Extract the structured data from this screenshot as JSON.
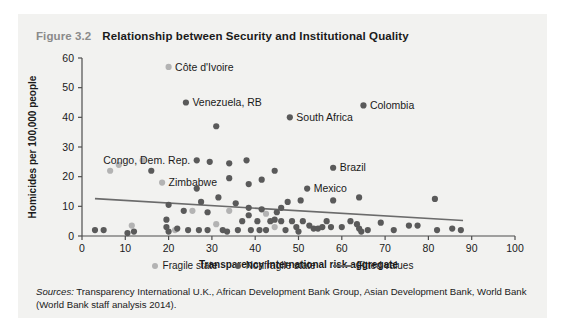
{
  "figure": {
    "number": "Figure 3.2",
    "title": "Relationship between Security and Institutional Quality",
    "sources_prefix": "Sources:",
    "sources_text": " Transparency International U.K., African Development Bank Group, Asian Development Bank, World Bank (World Bank staff analysis 2014)."
  },
  "legend": {
    "fragile_label": "Fragile state",
    "nonfragile_label": "Nonfragile state",
    "fitted_label": "Fitted values"
  },
  "colors": {
    "panel_background": "#f2f2f0",
    "fragile": "#b3b3b3",
    "nonfragile": "#5a5a5a",
    "fitted_line": "#6b6b6b",
    "axis": "#4d4d4d",
    "title": "#1a1a1a",
    "figure_number": "#8a8a8a"
  },
  "chart_data": {
    "type": "scatter",
    "title": "Relationship between Security and Institutional Quality",
    "xlabel": "Transparency International risk aggregate",
    "ylabel": "Homicides per 100,000 people",
    "xlim": [
      0,
      100
    ],
    "ylim": [
      0,
      60
    ],
    "xticks": [
      0,
      10,
      20,
      30,
      40,
      50,
      60,
      70,
      80,
      90,
      100
    ],
    "yticks": [
      0,
      10,
      20,
      30,
      40,
      50,
      60
    ],
    "grid": false,
    "legend_position": "bottom",
    "series": [
      {
        "name": "Fragile state",
        "color": "#b3b3b3",
        "points": [
          {
            "x": 20.0,
            "y": 57.0,
            "label": "Côte d'Ivoire",
            "label_side": "right"
          },
          {
            "x": 14.0,
            "y": 25.5
          },
          {
            "x": 8.5,
            "y": 24.0
          },
          {
            "x": 6.5,
            "y": 22.0
          },
          {
            "x": 18.5,
            "y": 18.0,
            "label": "Zimbabwe",
            "label_side": "right"
          },
          {
            "x": 34.0,
            "y": 8.5
          },
          {
            "x": 42.5,
            "y": 7.5
          },
          {
            "x": 31.0,
            "y": 4.0
          },
          {
            "x": 25.5,
            "y": 8.5
          },
          {
            "x": 11.5,
            "y": 3.5
          },
          {
            "x": 44.5,
            "y": 3.0
          },
          {
            "x": 21.5,
            "y": 2.0
          }
        ]
      },
      {
        "name": "Nonfragile state",
        "color": "#5a5a5a",
        "points": [
          {
            "x": 24.0,
            "y": 45.0,
            "label": "Venezuela, RB",
            "label_side": "right"
          },
          {
            "x": 65.0,
            "y": 44.0,
            "label": "Colombia",
            "label_side": "right"
          },
          {
            "x": 48.0,
            "y": 40.0,
            "label": "South Africa",
            "label_side": "right"
          },
          {
            "x": 31.0,
            "y": 37.0
          },
          {
            "x": 58.0,
            "y": 23.0,
            "label": "Brazil",
            "label_side": "right"
          },
          {
            "x": 26.5,
            "y": 25.5,
            "label": "Congo, Dem. Rep.",
            "label_side": "left"
          },
          {
            "x": 29.5,
            "y": 25.0
          },
          {
            "x": 52.0,
            "y": 16.0,
            "label": "Mexico",
            "label_side": "right"
          },
          {
            "x": 16.0,
            "y": 22.0
          },
          {
            "x": 34.0,
            "y": 24.5
          },
          {
            "x": 38.0,
            "y": 25.5
          },
          {
            "x": 44.5,
            "y": 22.0
          },
          {
            "x": 34.0,
            "y": 19.5
          },
          {
            "x": 41.5,
            "y": 19.0
          },
          {
            "x": 38.5,
            "y": 17.5
          },
          {
            "x": 26.5,
            "y": 16.0
          },
          {
            "x": 31.5,
            "y": 13.0
          },
          {
            "x": 27.5,
            "y": 11.5
          },
          {
            "x": 35.5,
            "y": 11.0
          },
          {
            "x": 20.0,
            "y": 10.5
          },
          {
            "x": 23.5,
            "y": 8.5
          },
          {
            "x": 29.0,
            "y": 8.0
          },
          {
            "x": 38.5,
            "y": 9.5
          },
          {
            "x": 38.5,
            "y": 7.0
          },
          {
            "x": 41.5,
            "y": 9.0
          },
          {
            "x": 46.0,
            "y": 9.5
          },
          {
            "x": 47.5,
            "y": 11.5
          },
          {
            "x": 45.0,
            "y": 8.0
          },
          {
            "x": 50.5,
            "y": 12.0
          },
          {
            "x": 58.0,
            "y": 12.0
          },
          {
            "x": 64.0,
            "y": 13.0
          },
          {
            "x": 81.5,
            "y": 12.5
          },
          {
            "x": 3.0,
            "y": 2.0
          },
          {
            "x": 5.0,
            "y": 2.0
          },
          {
            "x": 10.5,
            "y": 1.0
          },
          {
            "x": 12.0,
            "y": 1.5
          },
          {
            "x": 19.5,
            "y": 5.5
          },
          {
            "x": 19.5,
            "y": 3.0
          },
          {
            "x": 20.0,
            "y": 1.5
          },
          {
            "x": 22.0,
            "y": 2.5
          },
          {
            "x": 24.5,
            "y": 2.0
          },
          {
            "x": 27.0,
            "y": 2.0
          },
          {
            "x": 29.0,
            "y": 2.0
          },
          {
            "x": 32.5,
            "y": 2.0
          },
          {
            "x": 33.5,
            "y": 1.5
          },
          {
            "x": 36.0,
            "y": 2.0
          },
          {
            "x": 37.0,
            "y": 5.0
          },
          {
            "x": 39.0,
            "y": 2.0
          },
          {
            "x": 40.5,
            "y": 5.0
          },
          {
            "x": 41.0,
            "y": 2.0
          },
          {
            "x": 42.5,
            "y": 2.0
          },
          {
            "x": 43.5,
            "y": 5.0
          },
          {
            "x": 44.5,
            "y": 5.5
          },
          {
            "x": 46.0,
            "y": 5.0
          },
          {
            "x": 47.0,
            "y": 2.0
          },
          {
            "x": 48.5,
            "y": 5.0
          },
          {
            "x": 49.5,
            "y": 3.0
          },
          {
            "x": 50.0,
            "y": 1.5
          },
          {
            "x": 51.0,
            "y": 5.0
          },
          {
            "x": 52.5,
            "y": 3.5
          },
          {
            "x": 53.5,
            "y": 2.5
          },
          {
            "x": 54.5,
            "y": 2.5
          },
          {
            "x": 55.5,
            "y": 3.0
          },
          {
            "x": 56.5,
            "y": 5.0
          },
          {
            "x": 57.5,
            "y": 3.0
          },
          {
            "x": 60.0,
            "y": 3.0
          },
          {
            "x": 62.0,
            "y": 5.0
          },
          {
            "x": 63.5,
            "y": 4.0
          },
          {
            "x": 64.0,
            "y": 2.5
          },
          {
            "x": 64.5,
            "y": 1.5
          },
          {
            "x": 66.0,
            "y": 2.0
          },
          {
            "x": 69.0,
            "y": 4.5
          },
          {
            "x": 72.0,
            "y": 2.0
          },
          {
            "x": 75.5,
            "y": 3.5
          },
          {
            "x": 77.5,
            "y": 3.5
          },
          {
            "x": 82.0,
            "y": 2.0
          },
          {
            "x": 85.5,
            "y": 2.5
          },
          {
            "x": 87.5,
            "y": 2.0
          }
        ]
      }
    ],
    "fitted_line": {
      "name": "Fitted values",
      "color": "#6b6b6b",
      "x0": 3.0,
      "y0": 12.6,
      "x1": 88.0,
      "y1": 5.2
    }
  }
}
